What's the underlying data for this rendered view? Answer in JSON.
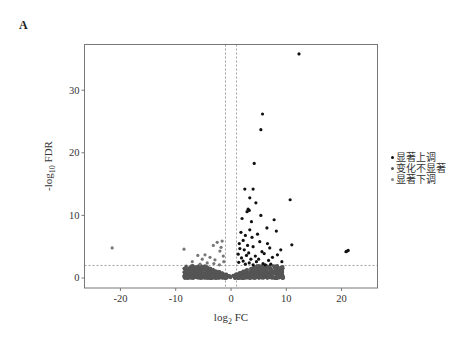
{
  "panel_label": "A",
  "legend": {
    "items": [
      {
        "label": "显著上调",
        "color": "#111111"
      },
      {
        "label": "变化不显著",
        "color": "#555555"
      },
      {
        "label": "显著下调",
        "color": "#888888"
      }
    ]
  },
  "axes": {
    "x_title_main": "log",
    "x_title_sub": "2",
    "x_title_rest": " FC",
    "y_title_pre": "-log",
    "y_title_sub": "10",
    "y_title_rest": " FDR"
  },
  "chart_data": {
    "type": "scatter",
    "title": "",
    "xlabel": "log2 FC",
    "ylabel": "-log10 FDR",
    "xlim": [
      -26.5,
      26.5
    ],
    "ylim": [
      -1.6,
      37.3
    ],
    "xticks": [
      -20,
      -10,
      0,
      10,
      20
    ],
    "yticks": [
      0,
      10,
      20,
      30
    ],
    "grid": false,
    "legend_position": "right",
    "thresholds": {
      "fc_lines": [
        -1,
        1
      ],
      "fdr_line": 2
    },
    "series": [
      {
        "name": "显著上调",
        "color": "#111111",
        "points": [
          [
            12.3,
            35.8
          ],
          [
            5.7,
            26.2
          ],
          [
            5.4,
            23.7
          ],
          [
            4.2,
            18.3
          ],
          [
            2.5,
            14.2
          ],
          [
            4.0,
            14.2
          ],
          [
            3.4,
            12.8
          ],
          [
            10.7,
            12.5
          ],
          [
            4.5,
            12.0
          ],
          [
            3.1,
            11.0
          ],
          [
            3.3,
            10.8
          ],
          [
            2.9,
            10.6
          ],
          [
            5.4,
            10.0
          ],
          [
            7.8,
            9.3
          ],
          [
            2.0,
            9.5
          ],
          [
            3.7,
            9.0
          ],
          [
            6.5,
            8.0
          ],
          [
            3.4,
            7.7
          ],
          [
            8.2,
            7.5
          ],
          [
            1.8,
            7.3
          ],
          [
            4.8,
            7.0
          ],
          [
            2.6,
            6.8
          ],
          [
            3.8,
            6.5
          ],
          [
            2.2,
            6.0
          ],
          [
            5.2,
            5.8
          ],
          [
            6.6,
            5.5
          ],
          [
            1.5,
            5.5
          ],
          [
            3.0,
            5.2
          ],
          [
            11.0,
            5.3
          ],
          [
            4.0,
            5.0
          ],
          [
            7.0,
            4.8
          ],
          [
            9.0,
            4.5
          ],
          [
            1.6,
            4.7
          ],
          [
            2.4,
            4.5
          ],
          [
            5.6,
            4.2
          ],
          [
            3.2,
            4.0
          ],
          [
            6.0,
            3.9
          ],
          [
            8.4,
            3.7
          ],
          [
            1.3,
            3.8
          ],
          [
            2.8,
            3.6
          ],
          [
            4.4,
            3.5
          ],
          [
            7.5,
            3.3
          ],
          [
            1.9,
            3.2
          ],
          [
            3.6,
            3.0
          ],
          [
            5.0,
            3.0
          ],
          [
            6.8,
            2.8
          ],
          [
            2.2,
            2.7
          ],
          [
            4.6,
            2.6
          ],
          [
            9.2,
            2.6
          ],
          [
            1.4,
            2.5
          ],
          [
            3.3,
            2.4
          ],
          [
            5.8,
            2.3
          ],
          [
            7.2,
            2.2
          ],
          [
            2.6,
            2.2
          ],
          [
            4.0,
            2.1
          ],
          [
            6.2,
            2.1
          ],
          [
            20.8,
            4.2
          ],
          [
            21.0,
            4.3
          ],
          [
            21.2,
            4.4
          ]
        ]
      },
      {
        "name": "显著下调",
        "color": "#777777",
        "points": [
          [
            -21.5,
            4.8
          ],
          [
            -1.6,
            5.9
          ],
          [
            -2.5,
            5.7
          ],
          [
            -3.2,
            5.2
          ],
          [
            -1.8,
            4.9
          ],
          [
            -8.5,
            4.6
          ],
          [
            -2.0,
            4.3
          ],
          [
            -4.7,
            3.7
          ],
          [
            -6.0,
            3.6
          ],
          [
            -1.4,
            3.5
          ],
          [
            -3.8,
            3.3
          ],
          [
            -5.2,
            3.0
          ],
          [
            -2.9,
            2.9
          ],
          [
            -7.0,
            2.6
          ],
          [
            -1.3,
            2.6
          ],
          [
            -4.3,
            2.4
          ],
          [
            -3.1,
            2.3
          ],
          [
            -5.6,
            2.2
          ],
          [
            -2.1,
            2.1
          ]
        ]
      },
      {
        "name": "变化不显著",
        "color": "#555555",
        "cloud": {
          "x_range": [
            -8.5,
            9.5
          ],
          "y_max": 2.0,
          "n": 900
        }
      }
    ]
  }
}
